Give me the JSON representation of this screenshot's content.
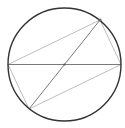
{
  "diagram": {
    "type": "geometry",
    "circle": {
      "cx": 64.5,
      "cy": 64.5,
      "r": 56.5,
      "stroke": "#333333"
    },
    "center": {
      "x": 64.5,
      "y": 64.5
    },
    "points": {
      "A": {
        "x": 100,
        "y": 20
      },
      "B": {
        "x": 121,
        "y": 64.5
      },
      "C": {
        "x": 29,
        "y": 109
      },
      "D": {
        "x": 8,
        "y": 64.5
      }
    },
    "colors": {
      "circle": "#333333",
      "diameter": "#777777",
      "chord": "#b0b0b0",
      "point": "#666666"
    }
  }
}
